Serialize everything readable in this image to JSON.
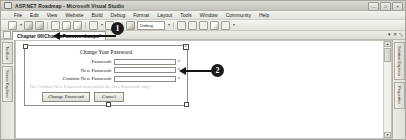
{
  "window": {
    "title": "ASP.NET Roadmap - Microsoft Visual Studio",
    "logo_icon": "visual-studio-logo-icon",
    "buttons": [
      {
        "name": "minimize",
        "glyph": "—"
      },
      {
        "name": "maximize",
        "glyph": "□"
      },
      {
        "name": "close",
        "glyph": "✕"
      }
    ]
  },
  "menubar": {
    "items": [
      {
        "label": "File"
      },
      {
        "label": "Edit"
      },
      {
        "label": "View"
      },
      {
        "label": "Website"
      },
      {
        "label": "Build"
      },
      {
        "label": "Debug"
      },
      {
        "label": "Format"
      },
      {
        "label": "Layout"
      },
      {
        "label": "Tools"
      },
      {
        "label": "Window"
      },
      {
        "label": "Community"
      },
      {
        "label": "Help"
      }
    ]
  },
  "toolbar": {
    "config_value": "Debug",
    "dropdown_arrow": "▾",
    "icons": [
      "new-project-icon",
      "save-icon",
      "save-all-icon",
      "cut-icon",
      "copy-icon",
      "paste-icon",
      "undo-icon",
      "redo-icon",
      "start-debug-icon",
      "comment-icon",
      "uncomment-icon",
      "indent-icon",
      "window-icon",
      "find-icon"
    ]
  },
  "tabstrip": {
    "active_tab": "Chapter 06\\ChangePassword.aspx*",
    "tab_icon": "document-icon",
    "dropdown_glyph": "▾",
    "close_glyph": "✕",
    "pin_glyph": "⤡"
  },
  "dock_left": {
    "tabs": [
      {
        "label": "Toolbox"
      },
      {
        "label": "Server Explorer"
      }
    ]
  },
  "dock_right": {
    "tabs": [
      {
        "label": "Solution Explorer"
      },
      {
        "label": "Properties"
      }
    ]
  },
  "designer": {
    "scrollbar": {
      "up_glyph": "▲",
      "down_glyph": "▼"
    },
    "change_password": {
      "heading": "Change Your Password",
      "fields": [
        {
          "label": "Password:",
          "value": "",
          "required_marker": "*"
        },
        {
          "label": "New Password:",
          "value": "",
          "required_marker": "*"
        },
        {
          "label": "Confirm New Password:",
          "value": "",
          "required_marker": "*"
        }
      ],
      "validation_message": "The Confirm New Password must match the New Password entry.",
      "buttons": [
        {
          "label": "Change Password"
        },
        {
          "label": "Cancel"
        }
      ],
      "smart_tag_glyph": "▸"
    }
  },
  "callouts": [
    {
      "number": "1"
    },
    {
      "number": "2"
    }
  ]
}
